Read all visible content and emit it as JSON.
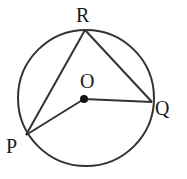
{
  "diagram": {
    "type": "circle-geometry",
    "stroke_color": "#333333",
    "points": {
      "R": {
        "label": "R"
      },
      "Q": {
        "label": "Q"
      },
      "P": {
        "label": "P"
      },
      "O": {
        "label": "O"
      }
    },
    "segments": [
      "RP",
      "RQ",
      "OP",
      "OQ"
    ],
    "center": "O"
  }
}
